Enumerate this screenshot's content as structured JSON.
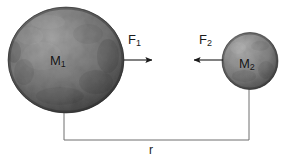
{
  "figure": {
    "background_color": "#ffffff",
    "width": 285,
    "height": 162
  },
  "bodies": [
    {
      "id": "large-sphere",
      "label_base": "M",
      "label_sub": "1",
      "name": "mass-one",
      "center_x": 66,
      "center_y": 60,
      "radius": 58,
      "fill_color": "#6f6f6f",
      "highlight_color": "#a9a9a9",
      "shadow_color": "#343434"
    },
    {
      "id": "small-sphere",
      "label_base": "M",
      "label_sub": "2",
      "name": "mass-two",
      "center_x": 250,
      "center_y": 61,
      "radius": 28,
      "fill_color": "#7a7a7a",
      "highlight_color": "#b2b2b2",
      "shadow_color": "#3b3b3b"
    }
  ],
  "forces": [
    {
      "id": "force-one",
      "label_base": "F",
      "label_sub": "1",
      "direction": "right",
      "x_start": 124,
      "x_end": 156,
      "y": 60,
      "color": "#1b1b1b"
    },
    {
      "id": "force-two",
      "label_base": "F",
      "label_sub": "2",
      "direction": "left",
      "x_start": 223,
      "x_end": 190,
      "y": 60,
      "color": "#1b1b1b"
    }
  ],
  "distance": {
    "label": "r",
    "left_x": 64,
    "right_x": 249,
    "baseline_y": 140,
    "left_top_y": 112,
    "right_top_y": 88,
    "color": "#6a6a6a"
  }
}
